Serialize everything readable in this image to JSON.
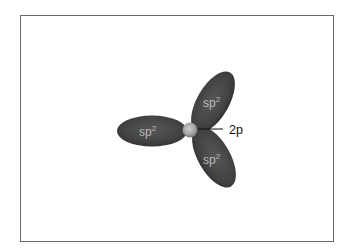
{
  "diagram": {
    "title": "",
    "type": "sp2 hybrid orbitals",
    "colors": {
      "frame_border": "#6a6a6a",
      "lobe_fill": "#404040",
      "lobe_highlight": "#5a5a5a",
      "lobe_text": "#b9b9b9",
      "nucleus_light": "#c8c8c8",
      "nucleus_dark": "#7a7a7a",
      "leader_line": "#111111",
      "label_text": "#111111"
    },
    "lobes": [
      {
        "id": "left",
        "label_base": "sp",
        "label_sup": "2",
        "angle_deg": 180
      },
      {
        "id": "upper-right",
        "label_base": "sp",
        "label_sup": "2",
        "angle_deg": -60
      },
      {
        "id": "lower-right",
        "label_base": "sp",
        "label_sup": "2",
        "angle_deg": 60
      }
    ],
    "nucleus": {
      "label": ""
    },
    "callout": {
      "label": "2p"
    }
  }
}
